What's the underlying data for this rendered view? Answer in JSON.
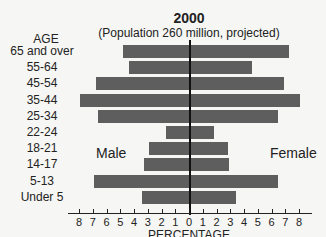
{
  "chart_data": {
    "type": "bar",
    "orientation": "horizontal",
    "subtype": "population-pyramid",
    "title": "2000",
    "subtitle": "(Population 260 million, projected)",
    "ylabel": "AGE",
    "xlabel": "PERCENTAGE",
    "categories": [
      "65 and over",
      "55-64",
      "45-54",
      "35-44",
      "25-34",
      "22-24",
      "18-21",
      "14-17",
      "5-13",
      "Under 5"
    ],
    "series": [
      {
        "name": "Male",
        "values": [
          4.8,
          4.4,
          6.8,
          7.9,
          6.6,
          1.7,
          2.9,
          3.3,
          6.9,
          3.4
        ]
      },
      {
        "name": "Female",
        "values": [
          7.3,
          4.6,
          6.9,
          8.1,
          6.5,
          1.8,
          2.8,
          2.9,
          6.5,
          3.4
        ]
      }
    ],
    "xticks": [
      8,
      7,
      6,
      5,
      4,
      3,
      2,
      1,
      0,
      1,
      2,
      3,
      4,
      5,
      6,
      7,
      8
    ],
    "xlim": [
      -8,
      8
    ],
    "bar_color": "#5e5e5e",
    "grid": false,
    "legend": "inline labels: Male (left), Female (right)"
  },
  "labels": {
    "title": "2000",
    "subtitle": "(Population 260 million, projected)",
    "age_header": "AGE",
    "male": "Male",
    "female": "Female",
    "xlabel": "PERCENTAGE"
  }
}
